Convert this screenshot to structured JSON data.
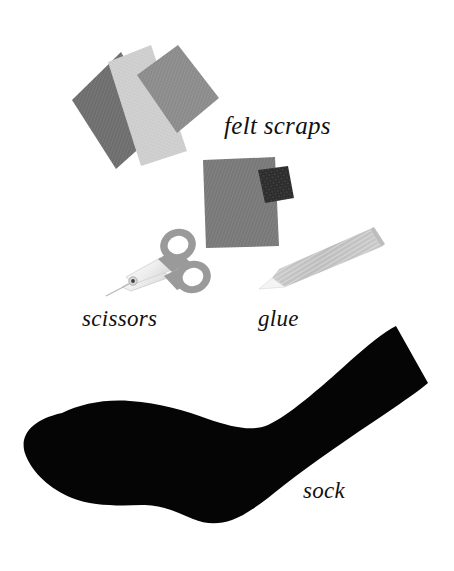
{
  "page": {
    "background_color": "#ffffff",
    "width": 454,
    "height": 571,
    "style": "instructional craft illustration with italic serif labels"
  },
  "labels": {
    "felt_scraps": "felt scraps",
    "scissors": "scissors",
    "glue": "glue",
    "sock": "sock"
  },
  "objects": [
    {
      "name": "felt-scraps-pile",
      "label": "felt scraps",
      "description": "three overlapping rotated felt rectangles plus one large square with a small black felt patch",
      "pieces": [
        {
          "name": "felt-piece-dark",
          "color": "#6e6e6e"
        },
        {
          "name": "felt-piece-light",
          "color": "#cfcfcf"
        },
        {
          "name": "felt-piece-medium",
          "color": "#8c8c8c"
        },
        {
          "name": "felt-piece-square",
          "color": "#797979"
        },
        {
          "name": "felt-piece-black",
          "color": "#2b2b2b"
        }
      ]
    },
    {
      "name": "scissors",
      "label": "scissors",
      "description": "small craft scissors with gray finger rings at upper right and white blades pointing to lower left",
      "handle_color": "#9a9a9a",
      "blade_color": "#f2f2f2",
      "pivot_color": "#4a4a4a"
    },
    {
      "name": "glue-bottle",
      "label": "glue",
      "description": "tapered light gray glue bottle angled from lower left to upper right with a white applicator tip",
      "body_color": "#c3c3c3",
      "tip_color": "#f4f4f4"
    },
    {
      "name": "sock",
      "label": "sock",
      "description": "solid black sock silhouette, rounded toe at left, heel at bottom center, cuff opening at upper right",
      "color": "#050505"
    }
  ],
  "colors": {
    "background": "#ffffff",
    "text": "#111111",
    "felt_dark": "#6e6e6e",
    "felt_light": "#cfcfcf",
    "felt_medium": "#8c8c8c",
    "felt_square": "#797979",
    "felt_black": "#2b2b2b",
    "tool_gray": "#9a9a9a",
    "tool_light": "#c3c3c3",
    "sock_black": "#050505"
  }
}
